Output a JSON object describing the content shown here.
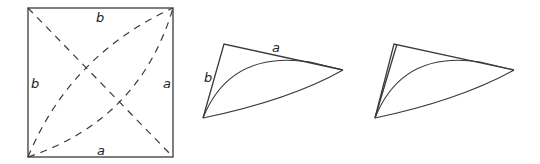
{
  "figure_1": {
    "description": "square with dashed diagonals and dashed curved arcs",
    "labels": {
      "top": "b",
      "left": "b",
      "right": "a",
      "bottom": "a"
    }
  },
  "figure_2": {
    "description": "triangle with curved arcs inside",
    "labels": {
      "top_edge": "a",
      "left_edge": "b"
    }
  },
  "figure_3": {
    "description": "folded triangle with curved arcs, no labels"
  }
}
